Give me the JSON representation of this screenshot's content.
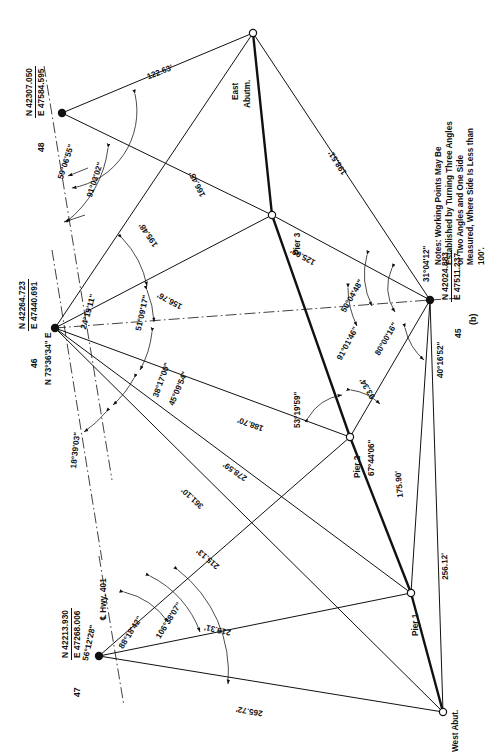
{
  "figure": {
    "label": "(b)"
  },
  "notes": {
    "text": "Notes: Working Points May Be Established by Turning Three Angles or Two Angles and One Side Measured, Where Side Is Less than 100'."
  },
  "control_points": [
    {
      "id": "48",
      "number": "48",
      "northing": "N 42307.050",
      "easting": "E 47584.595"
    },
    {
      "id": "46",
      "number": "46",
      "northing": "N 42264.723",
      "easting": "E 47440.691",
      "bearing": "N 73°36'34\" E"
    },
    {
      "id": "47",
      "number": "47",
      "northing": "N 42213.930",
      "easting": "E 47268.006"
    },
    {
      "id": "45",
      "number": "45",
      "northing": "N 42024.883",
      "easting": "E 47511.237"
    }
  ],
  "station_labels": [
    {
      "name": "east-abutment",
      "text": "East\nAbutm."
    },
    {
      "name": "pier-3",
      "text": "Pier 3"
    },
    {
      "name": "pier-2",
      "text": "Pier 2"
    },
    {
      "name": "pier-1",
      "text": "Pier 1"
    },
    {
      "name": "west-abutment",
      "text": "West Abut."
    },
    {
      "name": "highway-centerline",
      "text": "℄ Hwy. 401"
    }
  ],
  "stations": {
    "east_abutment": "East\nAbutm.",
    "east_abutment_line1": "East",
    "east_abutment_line2": "Abutm.",
    "pier3": "Pier 3",
    "pier2": "Pier 2",
    "pier1": "Pier 1",
    "west_abutment": "West Abut.",
    "highway": "℄ Hwy. 401"
  },
  "distances": [
    {
      "name": "dist-48-east-abutm",
      "value": "122.63'"
    },
    {
      "name": "dist-46-east-abutm",
      "value": "195.48'"
    },
    {
      "name": "dist-48-pier3",
      "value": "166.45'"
    },
    {
      "name": "dist-east-abutm-45",
      "value": "198.51'"
    },
    {
      "name": "dist-46-pier3",
      "value": "156.76'"
    },
    {
      "name": "dist-pier3-45",
      "value": "125.09'"
    },
    {
      "name": "dist-46-pier2",
      "value": "188.70'"
    },
    {
      "name": "dist-pier2-45",
      "value": "93.34'"
    },
    {
      "name": "dist-46-pier1",
      "value": "278.59'"
    },
    {
      "name": "dist-46-west-abutm",
      "value": "361.10'"
    },
    {
      "name": "dist-47-pier2",
      "value": "215.13'"
    },
    {
      "name": "dist-pier1-45",
      "value": "175.90'"
    },
    {
      "name": "dist-47-pier1",
      "value": "219.31'"
    },
    {
      "name": "dist-west-abutm-45",
      "value": "256.12'"
    },
    {
      "name": "dist-47-west-abutm",
      "value": "265.72'"
    }
  ],
  "angles": [
    {
      "name": "angle-48-a",
      "value": "59°06'55\""
    },
    {
      "name": "angle-48-b",
      "value": "91°03'02\""
    },
    {
      "name": "angle-46-a",
      "value": "24°19'11\""
    },
    {
      "name": "angle-46-b",
      "value": "51°09'17\""
    },
    {
      "name": "angle-46-c",
      "value": "38°17'00\""
    },
    {
      "name": "angle-46-d",
      "value": "45°09'54\""
    },
    {
      "name": "angle-46-e",
      "value": "18°39'03\""
    },
    {
      "name": "angle-45-a",
      "value": "31°04'12\""
    },
    {
      "name": "angle-45-b",
      "value": "50°04'48\""
    },
    {
      "name": "angle-45-c",
      "value": "91°01'46\""
    },
    {
      "name": "angle-45-d",
      "value": "80°00'16\""
    },
    {
      "name": "angle-45-e",
      "value": "40°16'52\""
    },
    {
      "name": "angle-pier2-a",
      "value": "53°19'59\""
    },
    {
      "name": "angle-pier2-b",
      "value": "67°44'06\""
    },
    {
      "name": "angle-47-a",
      "value": "56°12'28\""
    },
    {
      "name": "angle-47-b",
      "value": "88°18'42\""
    },
    {
      "name": "angle-47-c",
      "value": "106°38'07\""
    }
  ],
  "colors": {
    "line": "#111111",
    "text": "#111111",
    "background": "#ffffff"
  }
}
